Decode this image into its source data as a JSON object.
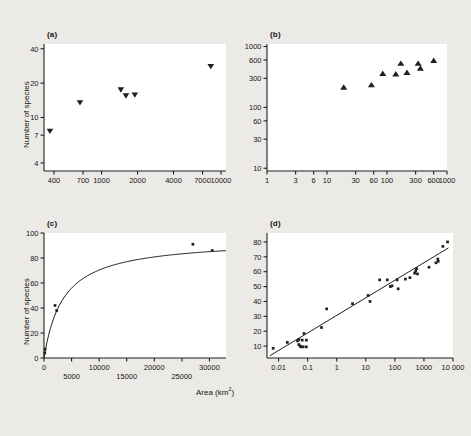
{
  "figure": {
    "background_color": "#eceae6",
    "plot_background_color": "#ffffff",
    "ink_color": "#1f1f1f",
    "shared_xlabel": "Area (km",
    "shared_xlabel_sup": "2",
    "shared_xlabel_tail": ")"
  },
  "panels": {
    "a": {
      "label": "(a)",
      "ylabel": "Number of species"
    },
    "b": {
      "label": "(b)"
    },
    "c": {
      "label": "(c)",
      "ylabel": "Number of species"
    },
    "d": {
      "label": "(d)"
    }
  },
  "chart_data": [
    {
      "id": "a",
      "type": "scatter",
      "title": "(a)",
      "xlabel": "Area (km2)",
      "ylabel": "Number of species",
      "xscale": "log",
      "yscale": "log",
      "xlim": [
        330,
        11000
      ],
      "ylim": [
        3.4,
        44
      ],
      "xticks": [
        400,
        700,
        1000,
        2000,
        4000,
        7000,
        10000
      ],
      "xticklabels": [
        "400",
        "700",
        "1000",
        "2000",
        "4000",
        "7000",
        "10000"
      ],
      "yticks": [
        4,
        7,
        10,
        20,
        40
      ],
      "yticklabels": [
        "4",
        "7",
        "10",
        "20",
        "40"
      ],
      "grid": false,
      "marker": "triangle-down",
      "points": [
        {
          "x": 370,
          "y": 7.6
        },
        {
          "x": 660,
          "y": 13.5
        },
        {
          "x": 1450,
          "y": 17.5
        },
        {
          "x": 1600,
          "y": 15.5
        },
        {
          "x": 1900,
          "y": 15.8
        },
        {
          "x": 8200,
          "y": 28.0
        }
      ]
    },
    {
      "id": "b",
      "type": "scatter",
      "title": "(b)",
      "xlabel": "Area (km2)",
      "ylabel": "",
      "xscale": "log",
      "yscale": "log",
      "xlim": [
        1,
        1000
      ],
      "ylim": [
        9,
        1100
      ],
      "xticks": [
        1,
        3,
        6,
        10,
        30,
        60,
        100,
        300,
        600,
        1000
      ],
      "xticklabels": [
        "1",
        "3",
        "6",
        "10",
        "30",
        "60",
        "100",
        "300",
        "600",
        "1000"
      ],
      "yticks": [
        10,
        30,
        60,
        100,
        300,
        600,
        1000
      ],
      "yticklabels": [
        "10",
        "30",
        "60",
        "100",
        "300",
        "600",
        "1000"
      ],
      "grid": false,
      "marker": "triangle-up",
      "points": [
        {
          "x": 19,
          "y": 215
        },
        {
          "x": 55,
          "y": 235
        },
        {
          "x": 85,
          "y": 360
        },
        {
          "x": 140,
          "y": 355
        },
        {
          "x": 170,
          "y": 530
        },
        {
          "x": 215,
          "y": 375
        },
        {
          "x": 330,
          "y": 530
        },
        {
          "x": 360,
          "y": 440
        },
        {
          "x": 600,
          "y": 590
        }
      ]
    },
    {
      "id": "c",
      "type": "scatter",
      "title": "(c)",
      "xlabel": "Area (km2)",
      "ylabel": "Number of species",
      "xscale": "linear",
      "yscale": "linear",
      "xlim": [
        0,
        33000
      ],
      "ylim": [
        0,
        100
      ],
      "xticks": [
        0,
        5000,
        10000,
        15000,
        20000,
        25000,
        30000
      ],
      "xticklabels": [
        "0",
        "5000",
        "10000",
        "15000",
        "20000",
        "25000",
        "30000"
      ],
      "yticks": [
        0,
        20,
        40,
        60,
        80,
        100
      ],
      "yticklabels": [
        "0",
        "20",
        "40",
        "60",
        "80",
        "100"
      ],
      "grid": false,
      "marker": "square",
      "points": [
        {
          "x": 150,
          "y": 4
        },
        {
          "x": 200,
          "y": 7
        },
        {
          "x": 2000,
          "y": 42
        },
        {
          "x": 2300,
          "y": 38
        },
        {
          "x": 27000,
          "y": 91
        },
        {
          "x": 30500,
          "y": 86
        }
      ],
      "fit_curve": {
        "kind": "saturating",
        "equation": "S = Smax * A / (K + A)",
        "Smax": 95,
        "K": 3500
      }
    },
    {
      "id": "d",
      "type": "scatter",
      "title": "(d)",
      "xlabel": "Area (km2)",
      "ylabel": "",
      "xscale": "log",
      "yscale": "linear",
      "xlim": [
        0.004,
        10000
      ],
      "ylim": [
        2,
        86
      ],
      "xticks": [
        0.01,
        0.1,
        1,
        10,
        100,
        1000,
        10000
      ],
      "xticklabels": [
        "0.01",
        "0.1",
        "1",
        "10",
        "100",
        "1000",
        "10 000"
      ],
      "yticks": [
        10,
        20,
        30,
        40,
        50,
        60,
        70,
        80
      ],
      "yticklabels": [
        "10",
        "20",
        "30",
        "40",
        "50",
        "60",
        "70",
        "80"
      ],
      "grid": false,
      "marker": "square",
      "fit_line": {
        "kind": "log-linear",
        "x1": 0.005,
        "y1": 3.5,
        "x2": 7000,
        "y2": 76
      },
      "points": [
        {
          "x": 0.0065,
          "y": 8.5
        },
        {
          "x": 0.02,
          "y": 12.5
        },
        {
          "x": 0.045,
          "y": 13.5
        },
        {
          "x": 0.05,
          "y": 14.5
        },
        {
          "x": 0.05,
          "y": 11.0
        },
        {
          "x": 0.055,
          "y": 10.0
        },
        {
          "x": 0.06,
          "y": 9.5
        },
        {
          "x": 0.065,
          "y": 14.0
        },
        {
          "x": 0.07,
          "y": 9.5
        },
        {
          "x": 0.075,
          "y": 18.5
        },
        {
          "x": 0.09,
          "y": 14.0
        },
        {
          "x": 0.09,
          "y": 9.5
        },
        {
          "x": 0.3,
          "y": 22.5
        },
        {
          "x": 0.45,
          "y": 35.0
        },
        {
          "x": 3.5,
          "y": 38.5
        },
        {
          "x": 12,
          "y": 44.0
        },
        {
          "x": 14,
          "y": 40.0
        },
        {
          "x": 30,
          "y": 54.5
        },
        {
          "x": 55,
          "y": 54.5
        },
        {
          "x": 70,
          "y": 50.0
        },
        {
          "x": 80,
          "y": 50.5
        },
        {
          "x": 120,
          "y": 54.5
        },
        {
          "x": 130,
          "y": 48.5
        },
        {
          "x": 230,
          "y": 55.0
        },
        {
          "x": 330,
          "y": 56.0
        },
        {
          "x": 480,
          "y": 59.0
        },
        {
          "x": 520,
          "y": 60.5
        },
        {
          "x": 560,
          "y": 62.0
        },
        {
          "x": 600,
          "y": 58.5
        },
        {
          "x": 1500,
          "y": 63.0
        },
        {
          "x": 2600,
          "y": 66.0
        },
        {
          "x": 3000,
          "y": 68.5
        },
        {
          "x": 3100,
          "y": 67.0
        },
        {
          "x": 4500,
          "y": 77.0
        },
        {
          "x": 6500,
          "y": 80.0
        }
      ]
    }
  ]
}
